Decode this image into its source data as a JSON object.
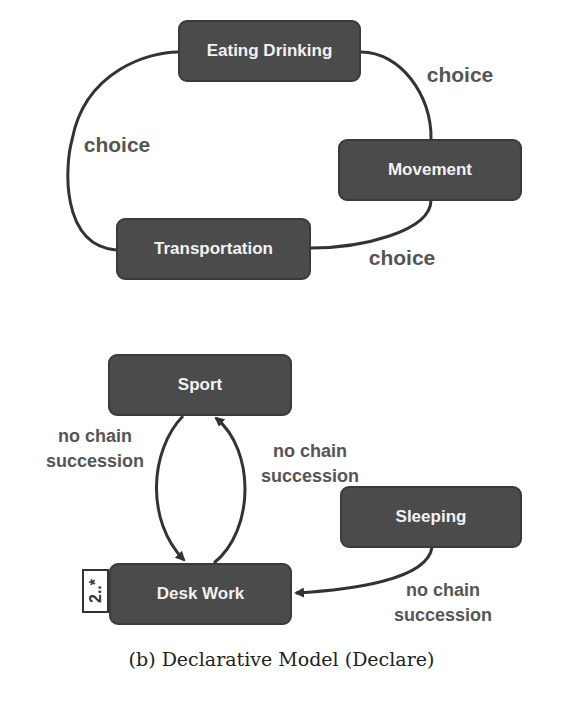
{
  "diagram_a": {
    "nodes": [
      {
        "id": "eating-drinking",
        "label": "Eating Drinking"
      },
      {
        "id": "movement",
        "label": "Movement"
      },
      {
        "id": "transportation",
        "label": "Transportation"
      }
    ],
    "edges": [
      {
        "from": "eating-drinking",
        "to": "movement",
        "label": "choice"
      },
      {
        "from": "movement",
        "to": "transportation",
        "label": "choice"
      },
      {
        "from": "transportation",
        "to": "eating-drinking",
        "label": "choice"
      }
    ]
  },
  "diagram_b": {
    "nodes": [
      {
        "id": "sport",
        "label": "Sport"
      },
      {
        "id": "desk-work",
        "label": "Desk Work",
        "cardinality": "2..*"
      },
      {
        "id": "sleeping",
        "label": "Sleeping"
      }
    ],
    "edges": [
      {
        "from": "sport",
        "to": "desk-work",
        "label_line1": "no chain",
        "label_line2": "succession"
      },
      {
        "from": "desk-work",
        "to": "sport",
        "label_line1": "no chain",
        "label_line2": "succession"
      },
      {
        "from": "sleeping",
        "to": "desk-work",
        "label_line1": "no chain",
        "label_line2": "succession"
      }
    ]
  },
  "caption": "(b) Declarative Model (Declare)",
  "colors": {
    "node_fill": "#4b4b4b",
    "node_text": "#f2f2f2",
    "edge": "#333333",
    "edge_label": "#555555"
  }
}
